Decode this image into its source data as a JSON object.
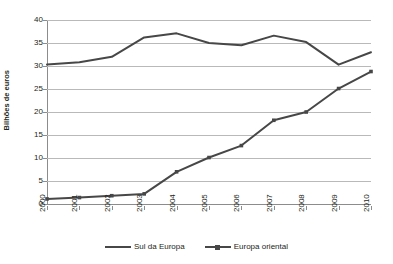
{
  "chart_data": {
    "type": "line",
    "title": "2000-2010",
    "xlabel": "",
    "ylabel": "Bilhões de euros",
    "x": [
      "2000",
      "2001",
      "2002",
      "2003",
      "2004",
      "2005",
      "2006",
      "2007",
      "2008",
      "2009",
      "2010"
    ],
    "categories": [
      "2000",
      "2001",
      "2002",
      "2003",
      "2004",
      "2005",
      "2006",
      "2007",
      "2008",
      "2009",
      "2010"
    ],
    "ylim": [
      0,
      40
    ],
    "yticks": [
      0,
      5,
      10,
      15,
      20,
      25,
      30,
      35,
      40
    ],
    "ytick_labels": [
      "0",
      "5",
      "10",
      "15",
      "20",
      "25",
      "30",
      "35",
      "40"
    ],
    "grid": "horizontal",
    "legend_position": "bottom",
    "series": [
      {
        "name": "Sul da Europa",
        "marker": "none",
        "color": "#474747",
        "values": [
          30.3,
          30.8,
          32.0,
          36.2,
          37.1,
          35.0,
          34.5,
          36.6,
          35.2,
          30.3,
          33.0
        ]
      },
      {
        "name": "Europa oriental",
        "marker": "square",
        "color": "#474747",
        "values": [
          1.1,
          1.4,
          1.8,
          2.2,
          7.0,
          10.1,
          12.7,
          18.2,
          20.0,
          25.1,
          28.8
        ]
      }
    ]
  },
  "legend": {
    "items": [
      {
        "label": "Sul da Europa",
        "marker": "none"
      },
      {
        "label": "Europa oriental",
        "marker": "square"
      }
    ]
  },
  "colors": {
    "series": "#474747",
    "gridline": "#b9b9b9",
    "axis": "#8c8c8c",
    "text": "#231f20",
    "background": "#ffffff"
  }
}
